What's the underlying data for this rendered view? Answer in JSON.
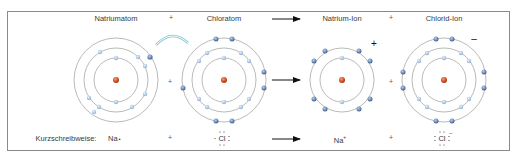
{
  "diagram": {
    "title_row": {
      "reactant_1": "Natriumatom",
      "plus_1": "+",
      "reactant_2": "Chloratom",
      "product_1": "Natrium-Ion",
      "plus_2": "+",
      "product_2": "Chlorid-Ion"
    },
    "middle_row": {
      "plus_1": "+",
      "plus_2": "+",
      "na_ion_charge": "+",
      "cl_ion_charge": "–"
    },
    "shorthand_row": {
      "label": "Kurzschreibweise:",
      "na_atom": "Na",
      "na_dot": "•",
      "plus_1": "+",
      "cl_atom": "Cl",
      "na_ion": "Na",
      "na_ion_sup": "+",
      "plus_2": "+",
      "cl_ion": "Cl",
      "cl_ion_sup": "–"
    },
    "atoms": [
      {
        "name": "Natriumatom",
        "shells": [
          2,
          8,
          1
        ]
      },
      {
        "name": "Chloratom",
        "shells": [
          2,
          8,
          7
        ]
      },
      {
        "name": "Natrium-Ion",
        "shells": [
          2,
          8
        ]
      },
      {
        "name": "Chlorid-Ion",
        "shells": [
          2,
          8,
          8
        ]
      }
    ],
    "colors": {
      "nucleus": "#d9501e",
      "electron": "#8fb0d8",
      "valence_electron": "#4a6fa5",
      "shell": "#8c8c8c",
      "transfer_arrow": "#7fc4cf",
      "frame": "#8a8a8a"
    }
  }
}
